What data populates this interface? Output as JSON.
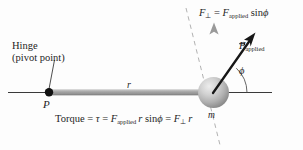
{
  "figure": {
    "name": "torque-lever-arm-diagram",
    "background_color": "#fdfdfd",
    "ink_color": "#1d1d1d",
    "rod_color": "#9a9a9a",
    "sphere_color_light": "#e2e2e2",
    "sphere_color_dark": "#8d8d8d",
    "fperp_arrow_color": "#9b9b9b",
    "fapplied_arrow_color": "#1a1a1a",
    "dashed_line_color": "#b0b0b0"
  },
  "labels": {
    "hinge_line1": "Hinge",
    "hinge_line2": "(pivot point)",
    "pivot_point": "P",
    "radius": "r",
    "mass": "m",
    "angle": "ϕ"
  },
  "fperp_equation": {
    "f": "F",
    "perp_symbol": "⊥",
    "equals": "=",
    "f2": "F",
    "applied_sub": "applied",
    "sin": "sin",
    "angle": "ϕ"
  },
  "fapplied_label": {
    "f": "F",
    "applied_sub": "applied"
  },
  "torque_equation": {
    "word": "Torque",
    "eq1": "=",
    "tau": "τ",
    "eq2": "=",
    "f_applied": "F",
    "applied_sub": "applied",
    "r1": "r",
    "sin": "sin",
    "angle": "ϕ",
    "eq3": "=",
    "f_perp": "F",
    "perp_symbol": "⊥",
    "r2": "r"
  }
}
